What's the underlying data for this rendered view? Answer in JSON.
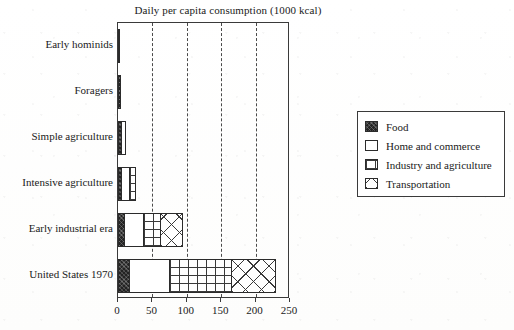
{
  "chart_data": {
    "type": "bar",
    "orientation": "horizontal",
    "stacked": true,
    "title": "Daily per capita consumption (1000 kcal)",
    "xlabel": "",
    "ylabel": "",
    "xlim": [
      0,
      250
    ],
    "xticks": [
      0,
      50,
      100,
      150,
      200,
      250
    ],
    "xticklabels": [
      "0",
      "50",
      "100",
      "150",
      "200",
      "250"
    ],
    "grid": "vertical-dashed",
    "legend_position": "right",
    "categories": [
      "Early hominids",
      "Foragers",
      "Simple agriculture",
      "Intensive agriculture",
      "Early industrial era",
      "United States 1970"
    ],
    "series": [
      {
        "name": "Food",
        "values": [
          3,
          5,
          6,
          6,
          10,
          18
        ]
      },
      {
        "name": "Home and commerce",
        "values": [
          0,
          0,
          6,
          12,
          28,
          57
        ]
      },
      {
        "name": "Industry and agriculture",
        "values": [
          0,
          0,
          0,
          8,
          24,
          91
        ]
      },
      {
        "name": "Transportation",
        "values": [
          0,
          0,
          0,
          0,
          33,
          64
        ]
      }
    ],
    "totals": [
      3,
      5,
      12,
      26,
      95,
      230
    ]
  },
  "legend": {
    "items": [
      {
        "label": "Food",
        "pattern": "solid-dark"
      },
      {
        "label": "Home and commerce",
        "pattern": "white"
      },
      {
        "label": "Industry and agriculture",
        "pattern": "grid"
      },
      {
        "label": "Transportation",
        "pattern": "cross-hatch"
      }
    ]
  },
  "colors": {
    "food": "#232323",
    "home": "#ffffff",
    "industry": "#ffffff",
    "transport": "#ffffff",
    "axis": "#3a3a3a",
    "text": "#1a1a1a"
  }
}
